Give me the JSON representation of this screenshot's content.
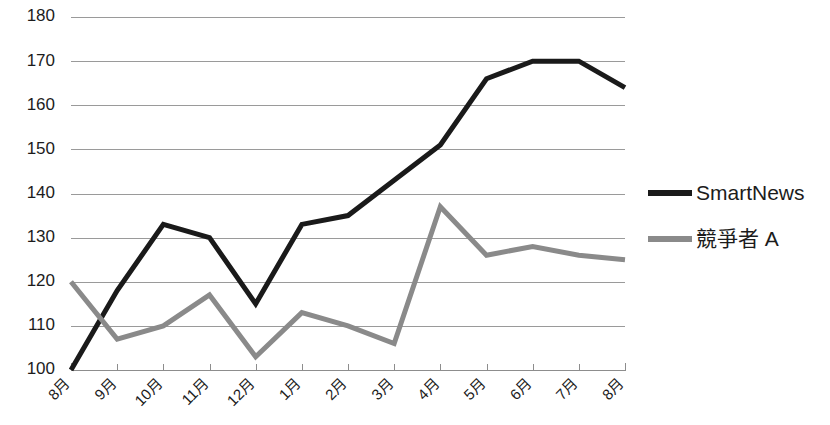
{
  "chart_data": {
    "type": "line",
    "title": "",
    "subtitle": "",
    "xlabel": "",
    "ylabel": "",
    "categories": [
      "8月",
      "9月",
      "10月",
      "11月",
      "12月",
      "1月",
      "2月",
      "3月",
      "4月",
      "5月",
      "6月",
      "7月",
      "8月"
    ],
    "series": [
      {
        "name": "SmartNews",
        "color": "#1a1a1a",
        "line_width": 5,
        "values": [
          100,
          118,
          133,
          130,
          115,
          133,
          135,
          143,
          151,
          166,
          170,
          170,
          164
        ]
      },
      {
        "name": "競爭者 A",
        "color": "#8a8a8a",
        "line_width": 5,
        "values": [
          120,
          107,
          110,
          117,
          103,
          113,
          110,
          106,
          137,
          126,
          128,
          126,
          125
        ]
      }
    ],
    "ylim": [
      100,
      180
    ],
    "ytick_values": [
      100,
      110,
      120,
      130,
      140,
      150,
      160,
      170,
      180
    ],
    "ytick_labels": [
      "100",
      "110",
      "120",
      "130",
      "140",
      "150",
      "160",
      "170",
      "180"
    ],
    "grid": true,
    "grid_axis": "y",
    "legend_position": "right",
    "background_color": "#ffffff",
    "grid_color": "#9a9a9a",
    "axis_color": "#8d8d8d",
    "xtick_label_rotation": -45
  }
}
